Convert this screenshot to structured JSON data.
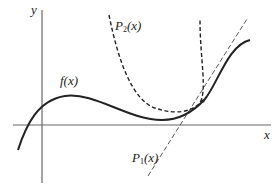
{
  "diagram": {
    "axes": {
      "x_label": "x",
      "y_label": "y",
      "color": "#555555"
    },
    "curves": [
      {
        "id": "f",
        "label": "f(x)",
        "style": "solid",
        "color": "#222222"
      },
      {
        "id": "P1",
        "label_base": "P",
        "label_sub": "1",
        "label_arg": "(x)",
        "style": "dashed-thin",
        "color": "#444444"
      },
      {
        "id": "P2",
        "label_base": "P",
        "label_sub": "2",
        "label_arg": "(x)",
        "style": "dashed",
        "color": "#222222"
      }
    ]
  }
}
